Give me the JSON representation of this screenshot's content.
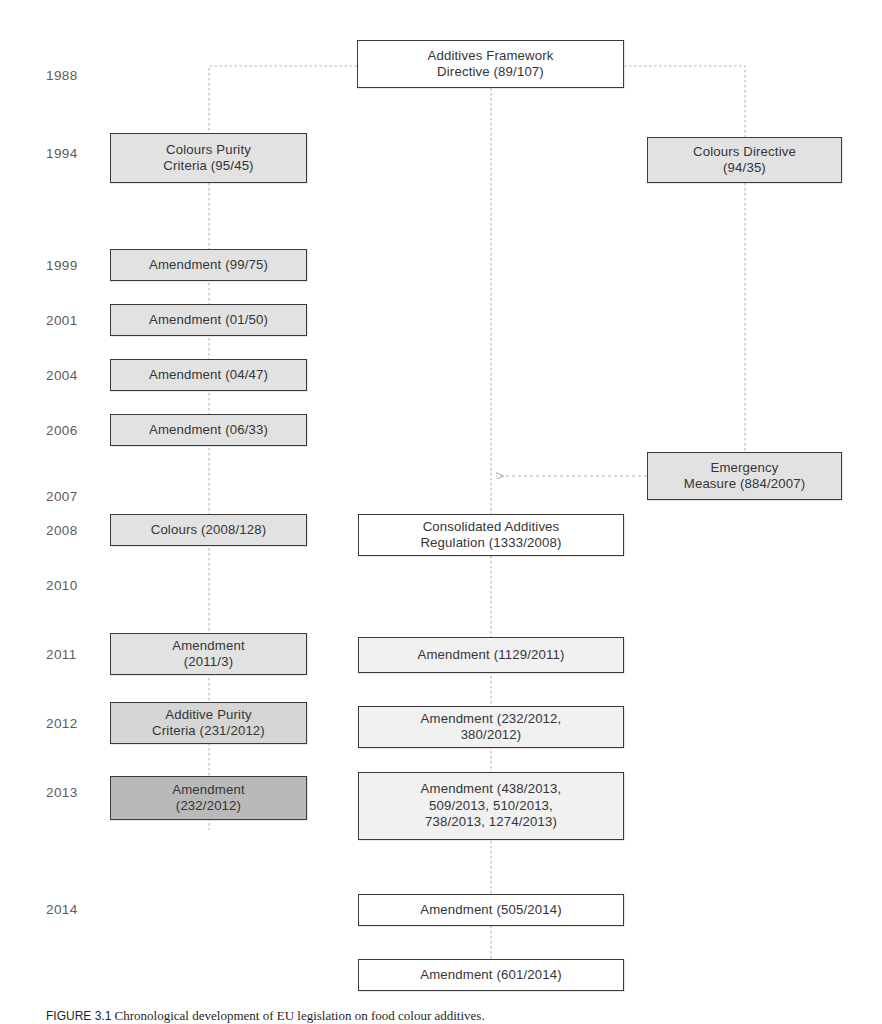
{
  "figure": {
    "caption_label": "FIGURE 3.1",
    "caption_text": "   Chronological development of EU legislation on food colour additives.",
    "colors": {
      "box_border": "#3a3a3a",
      "connector": "#b0b0b0",
      "text": "#353535",
      "year_text": "#5c5c5c",
      "fill_white": "#ffffff",
      "fill_lighter": "#f1f1f1",
      "fill_light": "#e2e2e2",
      "fill_mid": "#d6d6d6",
      "fill_dark": "#b9b9b9"
    }
  },
  "years": [
    {
      "label": "1988"
    },
    {
      "label": "1994"
    },
    {
      "label": "1999"
    },
    {
      "label": "2001"
    },
    {
      "label": "2004"
    },
    {
      "label": "2006"
    },
    {
      "label": "2007"
    },
    {
      "label": "2008"
    },
    {
      "label": "2010"
    },
    {
      "label": "2011"
    },
    {
      "label": "2012"
    },
    {
      "label": "2013"
    },
    {
      "label": "2014"
    }
  ],
  "nodes": [
    {
      "id": "additives-framework-directive",
      "line1": "Additives Framework",
      "line2": "Directive (89/107)"
    },
    {
      "id": "colours-purity-criteria",
      "line1": "Colours Purity",
      "line2": "Criteria (95/45)"
    },
    {
      "id": "colours-directive",
      "line1": "Colours Directive",
      "line2": "(94/35)"
    },
    {
      "id": "amendment-99-75",
      "line1": "Amendment (99/75)",
      "line2": ""
    },
    {
      "id": "amendment-01-50",
      "line1": "Amendment (01/50)",
      "line2": ""
    },
    {
      "id": "amendment-04-47",
      "line1": "Amendment (04/47)",
      "line2": ""
    },
    {
      "id": "amendment-06-33",
      "line1": "Amendment (06/33)",
      "line2": ""
    },
    {
      "id": "emergency-measure",
      "line1": "Emergency",
      "line2": "Measure (884/2007)"
    },
    {
      "id": "colours-2008-128",
      "line1": "Colours (2008/128)",
      "line2": ""
    },
    {
      "id": "consolidated-additives-regulation",
      "line1": "Consolidated Additives",
      "line2": "Regulation (1333/2008)"
    },
    {
      "id": "amendment-2011-3",
      "line1": "Amendment",
      "line2": "(2011/3)"
    },
    {
      "id": "amendment-1129-2011",
      "line1": "Amendment (1129/2011)",
      "line2": ""
    },
    {
      "id": "additive-purity-criteria",
      "line1": "Additive Purity",
      "line2": "Criteria (231/2012)"
    },
    {
      "id": "amendment-232-380-2012",
      "line1": "Amendment (232/2012,",
      "line2": "380/2012)"
    },
    {
      "id": "amendment-232-2012",
      "line1": "Amendment",
      "line2": "(232/2012)"
    },
    {
      "id": "amendment-2013-group-l1",
      "line1": "Amendment (438/2013,",
      "line2": "509/2013, 510/2013,",
      "line3": "738/2013, 1274/2013)"
    },
    {
      "id": "amendment-505-2014",
      "line1": "Amendment (505/2014)",
      "line2": ""
    },
    {
      "id": "amendment-601-2014",
      "line1": "Amendment (601/2014)",
      "line2": ""
    }
  ]
}
